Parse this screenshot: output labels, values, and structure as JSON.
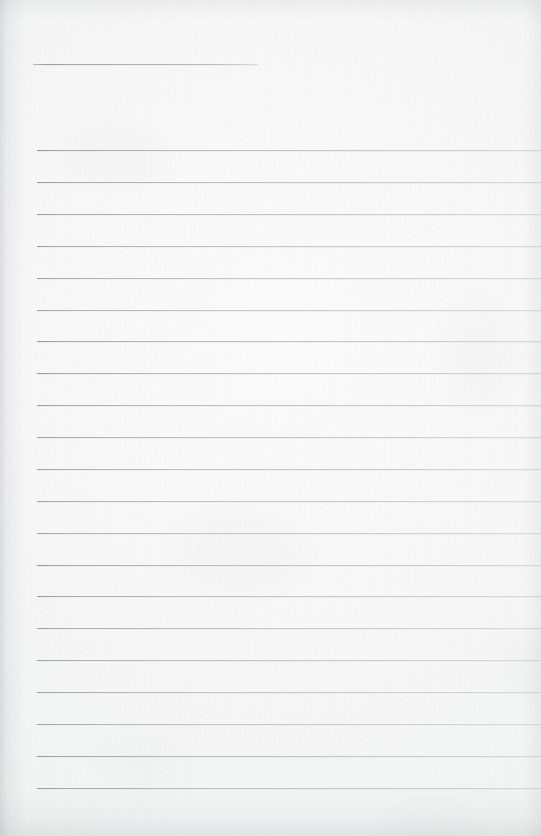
{
  "document": {
    "kind": "scanned-ruled-notebook-page",
    "title_text": "",
    "body_text": "",
    "page_width": 541,
    "page_height": 836,
    "paper_color": "#f8f8f9",
    "paper_highlight_color": "#fcfcfc",
    "paper_shadow_color": "#eceeee",
    "rule_color": "#a6acb2",
    "rule_color_light": "#bec3c8",
    "edge_shadow_color": "#969b9e"
  },
  "header_rule": {
    "name": "title-rule",
    "x": 33,
    "y": 64,
    "width": 225,
    "thickness": 1
  },
  "body_rules": {
    "left": 37,
    "right": 541,
    "first_y": 150,
    "spacing": 31.9,
    "count": 21,
    "thickness": 1,
    "lines": [
      {
        "index": 1,
        "y": 150
      },
      {
        "index": 2,
        "y": 182
      },
      {
        "index": 3,
        "y": 214
      },
      {
        "index": 4,
        "y": 246
      },
      {
        "index": 5,
        "y": 278
      },
      {
        "index": 6,
        "y": 310
      },
      {
        "index": 7,
        "y": 341
      },
      {
        "index": 8,
        "y": 373
      },
      {
        "index": 9,
        "y": 405
      },
      {
        "index": 10,
        "y": 437
      },
      {
        "index": 11,
        "y": 469
      },
      {
        "index": 12,
        "y": 501
      },
      {
        "index": 13,
        "y": 533
      },
      {
        "index": 14,
        "y": 565
      },
      {
        "index": 15,
        "y": 596
      },
      {
        "index": 16,
        "y": 628
      },
      {
        "index": 17,
        "y": 660
      },
      {
        "index": 18,
        "y": 692
      },
      {
        "index": 19,
        "y": 724
      },
      {
        "index": 20,
        "y": 756
      },
      {
        "index": 21,
        "y": 788
      }
    ]
  }
}
